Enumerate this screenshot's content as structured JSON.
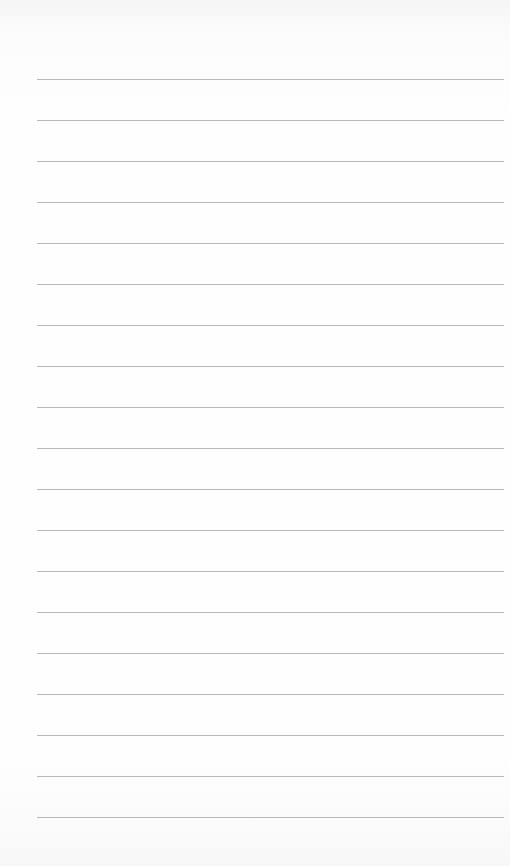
{
  "page": {
    "type": "lined-paper",
    "background_color": "#fdfdfd",
    "line_color": "#b9b9b9",
    "line_count": 19,
    "first_line_y": 79,
    "line_spacing": 41,
    "line_left": 37,
    "line_right": 504
  }
}
